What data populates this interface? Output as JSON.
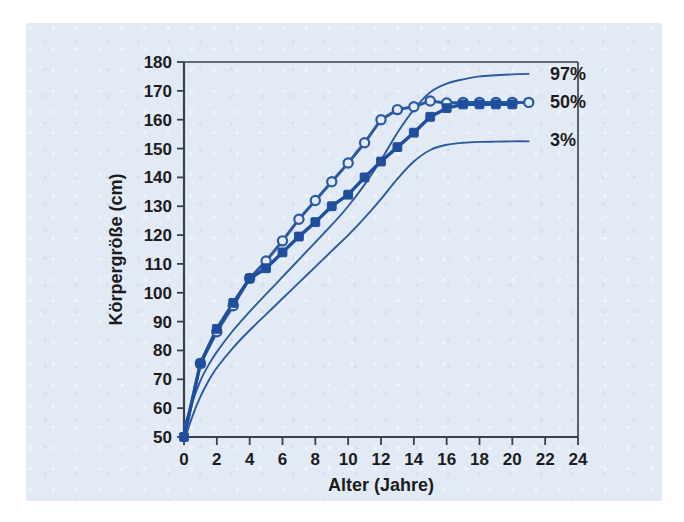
{
  "figure": {
    "panel_bg": "#e2eaf6",
    "page_bg": "#ffffff",
    "axis_color": "#3b3f46",
    "curve_color": "#2b5aa0",
    "marker_fill_color": "#1f4f9c",
    "marker_hollow_fill": "#e2eaf6"
  },
  "chart_data": {
    "type": "line",
    "title": "",
    "subtitle": "",
    "xlabel": "Alter (Jahre)",
    "ylabel": "Körpergröße (cm)",
    "xlim": [
      0,
      24
    ],
    "ylim": [
      50,
      180
    ],
    "xticks": [
      0,
      2,
      4,
      6,
      8,
      10,
      12,
      14,
      16,
      18,
      20,
      22,
      24
    ],
    "xtick_labels": [
      "0",
      "2",
      "4",
      "6",
      "8",
      "10",
      "12",
      "14",
      "16",
      "18",
      "20",
      "22",
      "24"
    ],
    "yticks": [
      50,
      60,
      70,
      80,
      90,
      100,
      110,
      120,
      130,
      140,
      150,
      160,
      170,
      180
    ],
    "ytick_labels": [
      "50",
      "60",
      "70",
      "80",
      "90",
      "100",
      "110",
      "120",
      "130",
      "140",
      "150",
      "160",
      "170",
      "180"
    ],
    "grid": false,
    "legend_position": "right-inline",
    "series": [
      {
        "name": "97%",
        "label": "97%",
        "style": "plain-line",
        "marker": "none",
        "color": "#2b5aa0",
        "x": [
          0,
          0.5,
          1,
          1.5,
          2,
          3,
          4,
          5,
          6,
          7,
          8,
          9,
          10,
          11,
          12,
          13,
          14,
          15,
          16,
          17,
          18,
          19,
          20,
          21
        ],
        "y": [
          53.5,
          62.0,
          69.5,
          75.0,
          79.5,
          87.0,
          93.5,
          99.5,
          105.5,
          111.5,
          117.5,
          123.5,
          130.0,
          137.5,
          146.0,
          155.5,
          163.5,
          169.5,
          172.5,
          174.0,
          175.0,
          175.4,
          175.7,
          175.9
        ]
      },
      {
        "name": "50%",
        "label": "50%",
        "style": "marker-line-hollow",
        "marker": "open-circle",
        "color": "#2b5aa0",
        "x": [
          0,
          1,
          2,
          3,
          4,
          5,
          6,
          7,
          8,
          9,
          10,
          11,
          12,
          13,
          14,
          15,
          16,
          17,
          18,
          19,
          20,
          21
        ],
        "y": [
          50.0,
          75.5,
          86.5,
          95.5,
          105.0,
          111.0,
          118.0,
          125.5,
          132.0,
          138.5,
          145.0,
          152.0,
          160.0,
          163.5,
          164.5,
          166.5,
          165.8,
          166.0,
          166.0,
          166.0,
          166.0,
          166.0
        ]
      },
      {
        "name": "3%",
        "label": "3%",
        "style": "plain-line",
        "marker": "none",
        "color": "#2b5aa0",
        "x": [
          0,
          0.5,
          1,
          1.5,
          2,
          3,
          4,
          5,
          6,
          7,
          8,
          9,
          10,
          11,
          12,
          13,
          14,
          15,
          16,
          17,
          18,
          19,
          20,
          21
        ],
        "y": [
          48.5,
          57.0,
          64.0,
          69.5,
          74.0,
          81.0,
          87.0,
          92.5,
          98.0,
          103.5,
          109.0,
          114.5,
          120.0,
          126.0,
          132.5,
          139.5,
          145.5,
          149.5,
          151.3,
          152.0,
          152.3,
          152.4,
          152.5,
          152.5
        ]
      },
      {
        "name": "patient-measurements",
        "label": "",
        "style": "marker-line-filled",
        "marker": "filled-square",
        "color": "#1f4f9c",
        "x": [
          0,
          1,
          2,
          3,
          4,
          5,
          6,
          7,
          8,
          9,
          10,
          11,
          12,
          13,
          14,
          15,
          16,
          17,
          18,
          19,
          20
        ],
        "y": [
          50.0,
          75.5,
          87.5,
          96.5,
          105.0,
          108.5,
          114.0,
          119.5,
          124.5,
          130.0,
          134.0,
          140.0,
          145.5,
          150.5,
          155.5,
          161.0,
          164.0,
          165.3,
          165.3,
          165.3,
          165.3
        ]
      }
    ],
    "annotations": [
      {
        "text": "97%",
        "x": 22.3,
        "y": 176.0
      },
      {
        "text": "50%",
        "x": 22.3,
        "y": 166.0
      },
      {
        "text": "3%",
        "x": 22.3,
        "y": 153.0
      }
    ]
  }
}
